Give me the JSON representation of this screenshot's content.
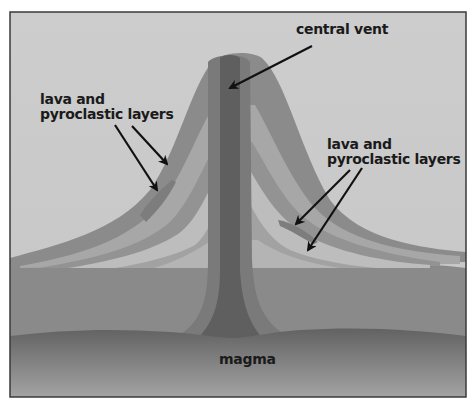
{
  "diagram": {
    "labels": {
      "central_vent": "central vent",
      "left_layers": {
        "line1": "lava and",
        "line2": "pyroclastic layers"
      },
      "right_layers": {
        "line1": "lava and",
        "line2": "pyroclastic layers"
      },
      "magma": "magma"
    },
    "colors": {
      "sky": "#c9c9c9",
      "frame": "#3a3a3a",
      "outer_layer": "#8c8c8c",
      "mid_layer": "#a5a5a5",
      "light_layer": "#bdbdbd",
      "vent_outer": "#7a7a7a",
      "vent_core": "#5e5e5e",
      "ground": "#8a8a8a",
      "magma_top": "#6a6a6a",
      "magma_bottom": "#a0a0a0",
      "arrow": "#111111"
    }
  }
}
